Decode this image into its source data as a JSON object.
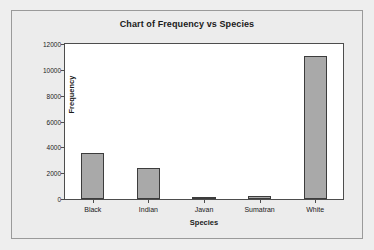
{
  "chart_data": {
    "type": "bar",
    "title": "Chart of Frequency vs Species",
    "xlabel": "Species",
    "ylabel": "Frequency",
    "categories": [
      "Black",
      "Indian",
      "Javan",
      "Sumatran",
      "White"
    ],
    "values": [
      3550,
      2400,
      60,
      250,
      11100
    ],
    "ylim": [
      0,
      12000
    ],
    "yticks": [
      0,
      2000,
      4000,
      6000,
      8000,
      10000,
      12000
    ],
    "ytick_labels": [
      "0",
      "2000",
      "4000",
      "6000",
      "8000",
      "10000",
      "12000"
    ],
    "grid": false,
    "legend": null,
    "bar_color": "#a9a9a9",
    "bar_edge_color": "#3c3c3c",
    "plot_background": "#ffffff",
    "figure_background": "#ececec"
  }
}
